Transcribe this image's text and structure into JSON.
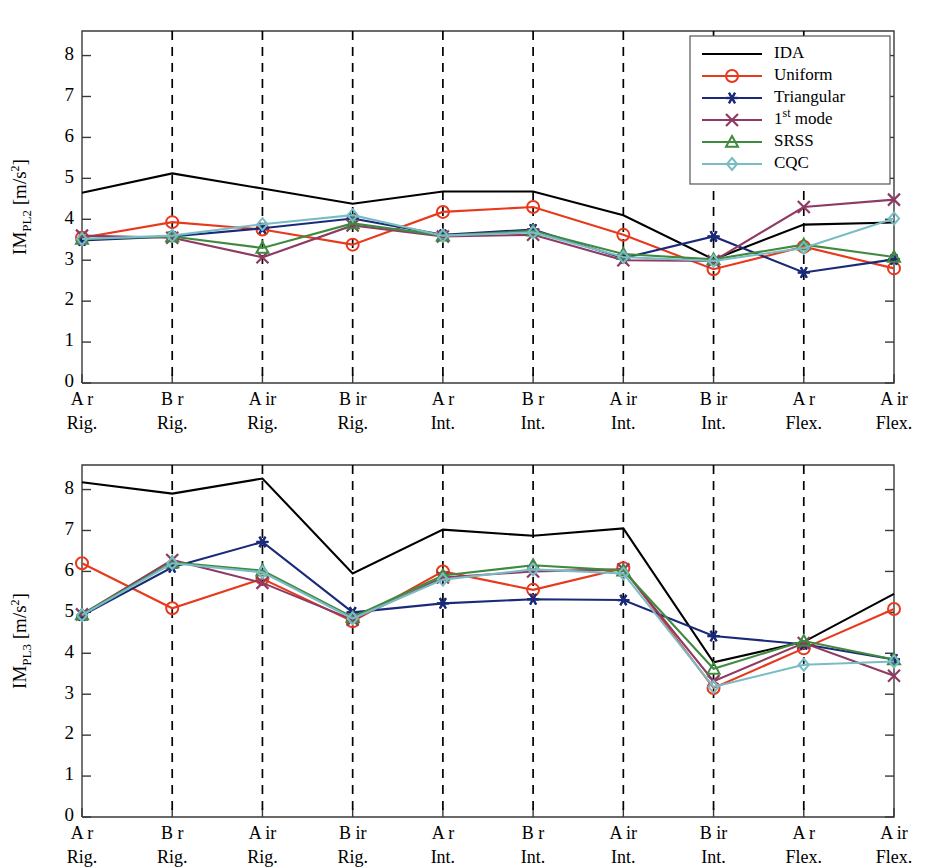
{
  "figure": {
    "panels": [
      "top",
      "bottom"
    ],
    "background": "#ffffff"
  },
  "colors": {
    "IDA": "#000000",
    "Uniform": "#e8391d",
    "Triangular": "#1b2a78",
    "1st mode": "#8e3a63",
    "SRSS": "#3f8a3f",
    "CQC": "#79bcc4",
    "separator": "#000000",
    "axis": "#3a3a3a"
  },
  "legend": {
    "position": "top-right (panel 1), bottom-left (panel 2)",
    "entries": [
      {
        "label": "IDA",
        "color": "#000000",
        "marker": "none"
      },
      {
        "label": "Uniform",
        "color": "#e8391d",
        "marker": "circle"
      },
      {
        "label": "Triangular",
        "color": "#1b2a78",
        "marker": "asterisk"
      },
      {
        "label": "1st mode",
        "color": "#8e3a63",
        "marker": "cross"
      },
      {
        "label": "SRSS",
        "color": "#3f8a3f",
        "marker": "triangle"
      },
      {
        "label": "CQC",
        "color": "#79bcc4",
        "marker": "diamond"
      }
    ],
    "first_mode_prefix": "1",
    "first_mode_superscript": "st",
    "first_mode_suffix": " mode"
  },
  "categories_top": [
    "A r",
    "B r",
    "A ir",
    "B ir",
    "A r",
    "B r",
    "A ir",
    "B ir",
    "A r",
    "A ir"
  ],
  "categories_bottom": [
    "Rig.",
    "Rig.",
    "Rig.",
    "Rig.",
    "Int.",
    "Int.",
    "Int.",
    "Int.",
    "Flex.",
    "Flex."
  ],
  "yticks": [
    "0",
    "1",
    "2",
    "3",
    "4",
    "5",
    "6",
    "7",
    "8"
  ],
  "chart_data": [
    {
      "type": "line",
      "id": "panel-top",
      "title": "",
      "ylabel_main": "IM",
      "ylabel_sub": "PL2",
      "ylabel_unit": " [m/s",
      "ylabel_unit_sup": "2",
      "ylabel_unit_close": "]",
      "ylabel": "IM_PL2 [m/s^2]",
      "xlabel": "",
      "ylim": [
        0,
        8.6
      ],
      "grid": "vertical dashed separators at every category",
      "legend_position": "top-right",
      "categories": [
        "A r Rig.",
        "B r Rig.",
        "A ir Rig.",
        "B ir Rig.",
        "A r Int.",
        "B r Int.",
        "A ir Int.",
        "B ir Int.",
        "A r Flex.",
        "A ir Flex."
      ],
      "series": [
        {
          "name": "IDA",
          "values": [
            4.65,
            5.12,
            4.75,
            4.38,
            4.68,
            4.68,
            4.1,
            3.02,
            3.87,
            3.92
          ]
        },
        {
          "name": "Uniform",
          "values": [
            3.55,
            3.93,
            3.75,
            3.38,
            4.18,
            4.3,
            3.62,
            2.78,
            3.33,
            2.8
          ]
        },
        {
          "name": "Triangular",
          "values": [
            3.48,
            3.58,
            3.78,
            4.02,
            3.62,
            3.75,
            3.05,
            3.58,
            2.7,
            3.02
          ]
        },
        {
          "name": "1st mode",
          "values": [
            3.6,
            3.55,
            3.07,
            3.85,
            3.58,
            3.62,
            3.0,
            2.98,
            4.3,
            4.48
          ]
        },
        {
          "name": "SRSS",
          "values": [
            3.52,
            3.58,
            3.3,
            3.9,
            3.6,
            3.72,
            3.15,
            3.02,
            3.38,
            3.08
          ]
        },
        {
          "name": "CQC",
          "values": [
            3.52,
            3.6,
            3.88,
            4.1,
            3.6,
            3.68,
            3.08,
            2.98,
            3.3,
            4.02
          ]
        }
      ]
    },
    {
      "type": "line",
      "id": "panel-bottom",
      "title": "",
      "ylabel_main": "IM",
      "ylabel_sub": "PL3",
      "ylabel_unit": " [m/s",
      "ylabel_unit_sup": "2",
      "ylabel_unit_close": "]",
      "ylabel": "IM_PL3 [m/s^2]",
      "xlabel": "",
      "ylim": [
        0,
        8.6
      ],
      "grid": "vertical dashed separators at every category",
      "legend_position": "bottom-left",
      "categories": [
        "A r Rig.",
        "B r Rig.",
        "A ir Rig.",
        "B ir Rig.",
        "A r Int.",
        "B r Int.",
        "A ir Int.",
        "B ir Int.",
        "A r Flex.",
        "A ir Flex."
      ],
      "series": [
        {
          "name": "IDA",
          "values": [
            8.18,
            7.9,
            8.27,
            5.95,
            7.02,
            6.87,
            7.05,
            3.78,
            4.28,
            5.45
          ]
        },
        {
          "name": "Uniform",
          "values": [
            6.2,
            5.1,
            5.82,
            4.78,
            6.0,
            5.55,
            6.08,
            3.15,
            4.12,
            5.08
          ]
        },
        {
          "name": "Triangular",
          "values": [
            4.92,
            6.1,
            6.72,
            5.0,
            5.22,
            5.32,
            5.3,
            4.42,
            4.22,
            3.85
          ]
        },
        {
          "name": "1st mode",
          "values": [
            4.95,
            6.28,
            5.72,
            4.82,
            5.85,
            6.0,
            6.05,
            3.32,
            4.25,
            3.45
          ]
        },
        {
          "name": "SRSS",
          "values": [
            4.95,
            6.22,
            6.02,
            4.88,
            5.9,
            6.15,
            6.02,
            3.62,
            4.3,
            3.85
          ]
        },
        {
          "name": "CQC",
          "values": [
            4.93,
            6.2,
            5.98,
            4.85,
            5.8,
            6.05,
            5.95,
            3.18,
            3.72,
            3.8
          ]
        }
      ]
    }
  ]
}
